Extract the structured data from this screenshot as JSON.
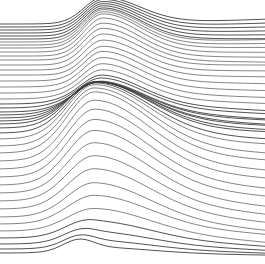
{
  "figure": {
    "background_color": "#ffffff",
    "line_color": "#3a3a3a",
    "width": 265,
    "height": 264
  },
  "chart_data": {
    "type": "line",
    "subtitle": "",
    "xlabel": "",
    "ylabel": "",
    "xlim": [
      0,
      265
    ],
    "ylim": [
      0,
      264
    ],
    "grid": false,
    "legend": "none",
    "axes_visible": false,
    "tick_labels_x": [],
    "tick_labels_y": [],
    "annotations": [],
    "series_count": 45,
    "line_width": 0.75,
    "baseline_spacing": 5.7,
    "waves": [
      {
        "name": "upper-crest",
        "center_x": 103,
        "sigma": 26,
        "max_amplitude": 34,
        "affects_rows": [
          0,
          22
        ]
      },
      {
        "name": "lower-crest",
        "center_x": 95,
        "sigma": 38,
        "max_amplitude": 62,
        "affects_rows": [
          22,
          45
        ]
      },
      {
        "name": "bottom-bump",
        "center_x": 78,
        "sigma": 15,
        "max_amplitude": 9,
        "affects_rows": [
          41,
          45
        ]
      }
    ],
    "series": [
      {
        "name": "line-01",
        "baseline_y": 24,
        "upper_amp": 26,
        "lower_amp": 0,
        "right_drift": -2,
        "tilt": -1
      },
      {
        "name": "line-02",
        "baseline_y": 27,
        "upper_amp": 27,
        "lower_amp": 0,
        "right_drift": -1,
        "tilt": -1
      },
      {
        "name": "line-03",
        "baseline_y": 30,
        "upper_amp": 28,
        "lower_amp": 0,
        "right_drift": 0,
        "tilt": -1
      },
      {
        "name": "line-04",
        "baseline_y": 33,
        "upper_amp": 29,
        "lower_amp": 0,
        "right_drift": 1,
        "tilt": -1
      },
      {
        "name": "line-05",
        "baseline_y": 36,
        "upper_amp": 30,
        "lower_amp": 0,
        "right_drift": 2,
        "tilt": -1
      },
      {
        "name": "line-06",
        "baseline_y": 39,
        "upper_amp": 31,
        "lower_amp": 0,
        "right_drift": 3,
        "tilt": -1
      },
      {
        "name": "line-07",
        "baseline_y": 42,
        "upper_amp": 32,
        "lower_amp": 0,
        "right_drift": 4,
        "tilt": -2
      },
      {
        "name": "line-08",
        "baseline_y": 45,
        "upper_amp": 33,
        "lower_amp": 0,
        "right_drift": 5,
        "tilt": -2
      },
      {
        "name": "line-09",
        "baseline_y": 48,
        "upper_amp": 34,
        "lower_amp": 0,
        "right_drift": 6,
        "tilt": -2
      },
      {
        "name": "line-10",
        "baseline_y": 52,
        "upper_amp": 34,
        "lower_amp": 0,
        "right_drift": 7,
        "tilt": -2
      },
      {
        "name": "line-11",
        "baseline_y": 56,
        "upper_amp": 33,
        "lower_amp": 0,
        "right_drift": 8,
        "tilt": -2
      },
      {
        "name": "line-12",
        "baseline_y": 60,
        "upper_amp": 32,
        "lower_amp": 0,
        "right_drift": 9,
        "tilt": -2
      },
      {
        "name": "line-13",
        "baseline_y": 65,
        "upper_amp": 31,
        "lower_amp": 0,
        "right_drift": 10,
        "tilt": -3
      },
      {
        "name": "line-14",
        "baseline_y": 70,
        "upper_amp": 30,
        "lower_amp": 0,
        "right_drift": 11,
        "tilt": -3
      },
      {
        "name": "line-15",
        "baseline_y": 75,
        "upper_amp": 29,
        "lower_amp": 0,
        "right_drift": 12,
        "tilt": -3
      },
      {
        "name": "line-16",
        "baseline_y": 81,
        "upper_amp": 28,
        "lower_amp": 2,
        "right_drift": 13,
        "tilt": -3
      },
      {
        "name": "line-17",
        "baseline_y": 87,
        "upper_amp": 26,
        "lower_amp": 4,
        "right_drift": 14,
        "tilt": -3
      },
      {
        "name": "line-18",
        "baseline_y": 93,
        "upper_amp": 24,
        "lower_amp": 6,
        "right_drift": 15,
        "tilt": -3
      },
      {
        "name": "line-19",
        "baseline_y": 99,
        "upper_amp": 21,
        "lower_amp": 9,
        "right_drift": 15,
        "tilt": -3
      },
      {
        "name": "line-20",
        "baseline_y": 104,
        "upper_amp": 18,
        "lower_amp": 12,
        "right_drift": 14,
        "tilt": -2
      },
      {
        "name": "line-21",
        "baseline_y": 108,
        "upper_amp": 15,
        "lower_amp": 16,
        "right_drift": 13,
        "tilt": -2
      },
      {
        "name": "line-22",
        "baseline_y": 112,
        "upper_amp": 12,
        "lower_amp": 20,
        "right_drift": 11,
        "tilt": -1
      },
      {
        "name": "line-23",
        "baseline_y": 115,
        "upper_amp": 9,
        "lower_amp": 25,
        "right_drift": 9,
        "tilt": -1
      },
      {
        "name": "line-24",
        "baseline_y": 118,
        "upper_amp": 7,
        "lower_amp": 30,
        "right_drift": 7,
        "tilt": 0
      },
      {
        "name": "line-25",
        "baseline_y": 121,
        "upper_amp": 5,
        "lower_amp": 35,
        "right_drift": 5,
        "tilt": 0
      },
      {
        "name": "line-26",
        "baseline_y": 124,
        "upper_amp": 3,
        "lower_amp": 40,
        "right_drift": 3,
        "tilt": 1
      },
      {
        "name": "line-27",
        "baseline_y": 128,
        "upper_amp": 2,
        "lower_amp": 45,
        "right_drift": 1,
        "tilt": 1
      },
      {
        "name": "line-28",
        "baseline_y": 133,
        "upper_amp": 1,
        "lower_amp": 50,
        "right_drift": 0,
        "tilt": 2
      },
      {
        "name": "line-29",
        "baseline_y": 139,
        "upper_amp": 0,
        "lower_amp": 55,
        "right_drift": -1,
        "tilt": 2
      },
      {
        "name": "line-30",
        "baseline_y": 146,
        "upper_amp": 0,
        "lower_amp": 59,
        "right_drift": -2,
        "tilt": 3
      },
      {
        "name": "line-31",
        "baseline_y": 153,
        "upper_amp": 0,
        "lower_amp": 62,
        "right_drift": -2,
        "tilt": 3
      },
      {
        "name": "line-32",
        "baseline_y": 161,
        "upper_amp": 0,
        "lower_amp": 62,
        "right_drift": -3,
        "tilt": 4
      },
      {
        "name": "line-33",
        "baseline_y": 169,
        "upper_amp": 0,
        "lower_amp": 61,
        "right_drift": -3,
        "tilt": 4
      },
      {
        "name": "line-34",
        "baseline_y": 177,
        "upper_amp": 0,
        "lower_amp": 59,
        "right_drift": -4,
        "tilt": 5
      },
      {
        "name": "line-35",
        "baseline_y": 185,
        "upper_amp": 0,
        "lower_amp": 56,
        "right_drift": -4,
        "tilt": 5
      },
      {
        "name": "line-36",
        "baseline_y": 193,
        "upper_amp": 0,
        "lower_amp": 52,
        "right_drift": -5,
        "tilt": 6
      },
      {
        "name": "line-37",
        "baseline_y": 201,
        "upper_amp": 0,
        "lower_amp": 47,
        "right_drift": -5,
        "tilt": 6
      },
      {
        "name": "line-38",
        "baseline_y": 209,
        "upper_amp": 0,
        "lower_amp": 42,
        "right_drift": -5,
        "tilt": 6
      },
      {
        "name": "line-39",
        "baseline_y": 217,
        "upper_amp": 0,
        "lower_amp": 36,
        "right_drift": -5,
        "tilt": 6
      },
      {
        "name": "line-40",
        "baseline_y": 224,
        "upper_amp": 0,
        "lower_amp": 30,
        "right_drift": -5,
        "tilt": 5
      },
      {
        "name": "line-41",
        "baseline_y": 231,
        "upper_amp": 0,
        "lower_amp": 24,
        "right_drift": -4,
        "tilt": 5
      },
      {
        "name": "line-42",
        "baseline_y": 238,
        "upper_amp": 0,
        "lower_amp": 18,
        "right_drift": -4,
        "tilt": 4
      },
      {
        "name": "line-43",
        "baseline_y": 244,
        "upper_amp": 0,
        "lower_amp": 13,
        "right_drift": -3,
        "tilt": 3
      },
      {
        "name": "line-44",
        "baseline_y": 249,
        "upper_amp": 0,
        "lower_amp": 9,
        "right_drift": -2,
        "tilt": 2
      },
      {
        "name": "line-45",
        "baseline_y": 253,
        "upper_amp": 0,
        "lower_amp": 6,
        "right_drift": -1,
        "tilt": 1
      }
    ]
  }
}
